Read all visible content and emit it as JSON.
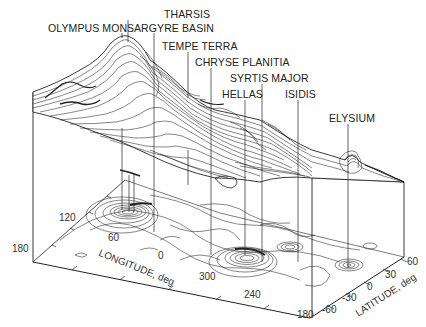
{
  "figure": {
    "features": [
      {
        "name": "THARSIS",
        "x": 164,
        "y": 9,
        "lx": 128,
        "ly1": 20,
        "ly2": 42
      },
      {
        "name": "OLYMPUS MONS",
        "x": 48,
        "y": 23,
        "lx": 122,
        "ly1": 33,
        "ly2": 210
      },
      {
        "name": "ARGYRE BASIN",
        "x": 134,
        "y": 23,
        "lx": 154,
        "ly1": 33,
        "ly2": 232
      },
      {
        "name": "TEMPE TERRA",
        "x": 162,
        "y": 41,
        "lx": 188,
        "ly1": 52,
        "ly2": 185
      },
      {
        "name": "CHRYSE PLANITIA",
        "x": 193,
        "y": 57,
        "lx": 211,
        "ly1": 68,
        "ly2": 255
      },
      {
        "name": "SYRTIS MAJOR",
        "x": 229,
        "y": 73,
        "lx": 262,
        "ly1": 84,
        "ly2": 262
      },
      {
        "name": "HELLAS",
        "x": 222,
        "y": 89,
        "lx": 245,
        "ly1": 100,
        "ly2": 255
      },
      {
        "name": "ISIDIS",
        "x": 285,
        "y": 89,
        "lx": 298,
        "ly1": 100,
        "ly2": 262
      },
      {
        "name": "ELYSIUM",
        "x": 329,
        "y": 113,
        "lx": 348,
        "ly1": 124,
        "ly2": 268
      }
    ],
    "longitude_axis": {
      "title": "LONGITUDE, deg",
      "ticks": [
        {
          "label": "180",
          "x": 14,
          "y": 244
        },
        {
          "label": "120",
          "x": 60,
          "y": 213
        },
        {
          "label": "60",
          "x": 108,
          "y": 233
        },
        {
          "label": "0",
          "x": 158,
          "y": 251
        },
        {
          "label": "300",
          "x": 197,
          "y": 271
        },
        {
          "label": "240",
          "x": 243,
          "y": 290
        },
        {
          "label": "180",
          "x": 297,
          "y": 310
        }
      ]
    },
    "latitude_axis": {
      "title": "LATITUDE, deg",
      "ticks": [
        {
          "label": "60",
          "x": 407,
          "y": 258
        },
        {
          "label": "30",
          "x": 385,
          "y": 272
        },
        {
          "label": "0",
          "x": 366,
          "y": 283
        },
        {
          "label": "-30",
          "x": 343,
          "y": 293
        },
        {
          "label": "-60",
          "x": 323,
          "y": 305
        }
      ]
    }
  }
}
